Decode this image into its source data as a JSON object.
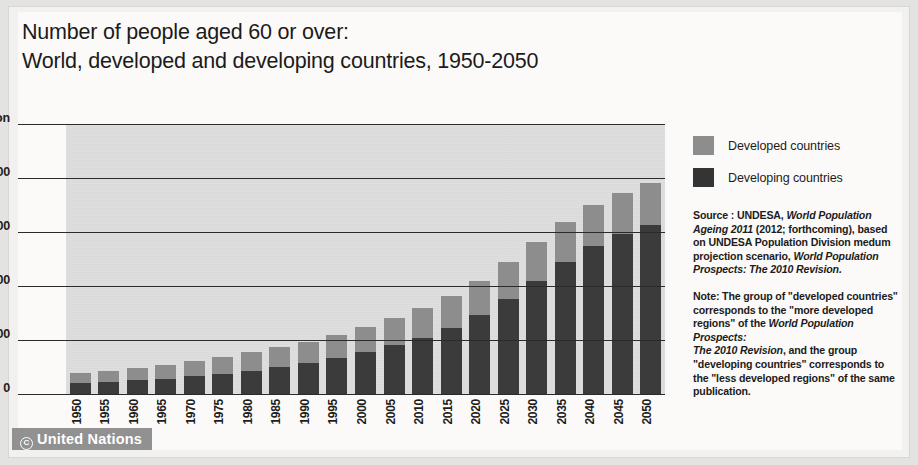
{
  "title": {
    "line1": "Number of people aged 60 or over:",
    "line2": "World, developed and developing countries, 1950-2050"
  },
  "legend": {
    "items": [
      {
        "label": "Developed countries",
        "color": "#8d8d8d"
      },
      {
        "label": "Developing countries",
        "color": "#343434"
      }
    ]
  },
  "source": {
    "line1": "Source : UNDESA, ",
    "line1_it": "World Population",
    "line2_it": "Ageing 2011",
    "line2": " (2012; forthcoming), based",
    "line3": "on UNDESA Population Division medum",
    "line4": "projection scenario, ",
    "line4_it": "World Population",
    "line5_it": "Prospects: The 2010 Revision."
  },
  "note": {
    "line1": "Note: The group of \"developed countries\"",
    "line2": "corresponds to the \"more developed",
    "line3": "regions\" of the ",
    "line3_it": "World Population Prospects:",
    "line4_it": "The 2010 Revision",
    "line4": ", and the group",
    "line5": "\"developing countries\" corresponds to",
    "line6": "the \"less developed regions\" of the same",
    "line7": "publication."
  },
  "watermark": {
    "symbol": "C",
    "text": "United Nations"
  },
  "chart_data": {
    "type": "bar",
    "stacked": true,
    "title": "Number of people aged 60 or over: World, developed and developing countries, 1950-2050",
    "xlabel": "",
    "ylabel": "",
    "y_unit": "million",
    "ylim": [
      0,
      2500
    ],
    "yticks": [
      0,
      500,
      1000,
      1500,
      2000,
      2500
    ],
    "ytick_labels": [
      "0",
      "500",
      "1,000",
      "1,500",
      "2,000",
      "2,500 million"
    ],
    "grid": true,
    "legend_position": "right",
    "categories": [
      "1950",
      "1955",
      "1960",
      "1965",
      "1970",
      "1975",
      "1980",
      "1985",
      "1990",
      "1995",
      "2000",
      "2005",
      "2010",
      "2015",
      "2020",
      "2025",
      "2030",
      "2035",
      "2040",
      "2045",
      "2050"
    ],
    "series": [
      {
        "name": "Developing countries",
        "color": "#3b3b3b",
        "values": [
          108,
          120,
          135,
          152,
          172,
          196,
          225,
          258,
          296,
          340,
          395,
          460,
          530,
          620,
          740,
          890,
          1060,
          1230,
          1380,
          1490,
          1570
        ]
      },
      {
        "name": "Developed countries",
        "color": "#8d8d8d",
        "values": [
          95,
          105,
          117,
          129,
          143,
          156,
          170,
          184,
          199,
          213,
          232,
          250,
          272,
          298,
          320,
          340,
          355,
          368,
          378,
          385,
          390
        ]
      }
    ],
    "totals": [
      203,
      225,
      252,
      281,
      315,
      352,
      395,
      442,
      495,
      553,
      627,
      710,
      802,
      918,
      1060,
      1230,
      1415,
      1598,
      1758,
      1875,
      1960
    ]
  }
}
